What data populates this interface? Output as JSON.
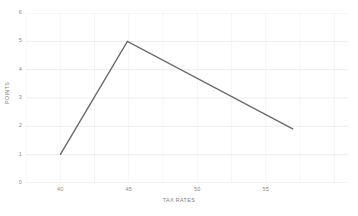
{
  "chart_data": {
    "type": "line",
    "title": "",
    "xlabel": "TAX RATES",
    "ylabel": "POINTS",
    "xlim": [
      37.5,
      61.0
    ],
    "ylim": [
      0,
      6
    ],
    "grid": true,
    "legend": false,
    "legend_position": "none",
    "x_ticks": [
      40,
      45,
      50,
      55
    ],
    "x_tick_labels": [
      "40",
      "45",
      "50",
      "55"
    ],
    "y_ticks": [
      0,
      1,
      2,
      3,
      4,
      5,
      6
    ],
    "y_tick_labels": [
      "0",
      "1",
      "2",
      "3",
      "4",
      "5",
      "6"
    ],
    "series": [
      {
        "name": "Points",
        "color": "#6b6b6b",
        "x": [
          40.0,
          44.9,
          57.0
        ],
        "y": [
          1.0,
          5.0,
          1.9
        ],
        "points": [
          {
            "x": 40.0,
            "y": 1.0
          },
          {
            "x": 44.9,
            "y": 5.0
          },
          {
            "x": 57.0,
            "y": 1.9
          }
        ]
      }
    ]
  },
  "style": {
    "line_color": "#6b6b6b",
    "grid_color": "#e9e9e9",
    "minor_grid_color": "#f2f2f2",
    "axis_color": "#e2e2e2",
    "tick_label_color": "#8d8d8d",
    "axis_title_color": "#7d7d7d",
    "background": "#ffffff"
  }
}
